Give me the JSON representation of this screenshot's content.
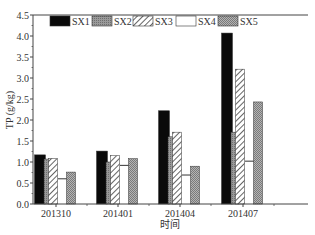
{
  "chart_data": {
    "type": "bar",
    "title": "",
    "xlabel": "时间",
    "ylabel": "TP (g/kg)",
    "ylim": [
      0,
      4.5
    ],
    "yticks": [
      0.0,
      0.5,
      1.0,
      1.5,
      2.0,
      2.5,
      3.0,
      3.5,
      4.0,
      4.5
    ],
    "categories": [
      "201310",
      "201401",
      "201404",
      "201407"
    ],
    "series": [
      {
        "name": "SX1",
        "pattern": "solid-black",
        "values": [
          1.17,
          1.26,
          2.22,
          4.07
        ]
      },
      {
        "name": "SX2",
        "pattern": "gray-fine",
        "values": [
          1.07,
          1.0,
          1.6,
          1.71
        ]
      },
      {
        "name": "SX3",
        "pattern": "diagonal-hatch",
        "values": [
          1.08,
          1.15,
          1.71,
          3.21
        ]
      },
      {
        "name": "SX4",
        "pattern": "white",
        "values": [
          0.6,
          0.92,
          0.69,
          1.02
        ]
      },
      {
        "name": "SX5",
        "pattern": "gray-dense",
        "values": [
          0.76,
          1.08,
          0.9,
          2.43
        ]
      }
    ],
    "legend_position": "top-inside",
    "grid": false
  }
}
